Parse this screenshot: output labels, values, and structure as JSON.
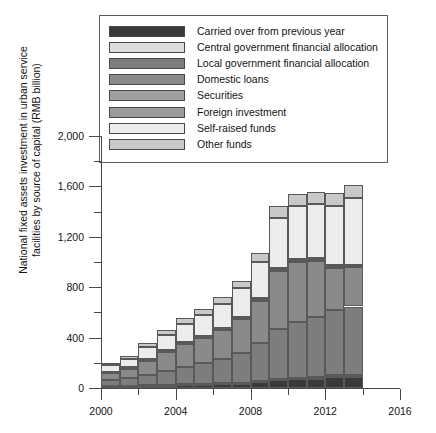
{
  "chart_data": {
    "type": "bar",
    "stacked": true,
    "title": "",
    "xlabel": "",
    "ylabel": "National fixed assets investment in urban service facilities by source of capital (RMB billion)",
    "ylabel_line1": "National fixed assets investment in urban service",
    "ylabel_line2": "facilities by source of capital (RMB billion)",
    "ylim": [
      0,
      2000
    ],
    "ytick_labels": [
      "0",
      "400",
      "800",
      "1,200",
      "1,600",
      "2,000"
    ],
    "ytick_values": [
      0,
      400,
      800,
      1200,
      1600,
      2000
    ],
    "yminor_values": [
      200,
      600,
      1000,
      1400,
      1800
    ],
    "xlim": [
      2000,
      2016
    ],
    "xtick_labels": [
      "2000",
      "2004",
      "2008",
      "2012",
      "2016"
    ],
    "xtick_values": [
      2000,
      2004,
      2008,
      2012,
      2016
    ],
    "xminor_values": [
      2002,
      2006,
      2010,
      2014
    ],
    "grid": false,
    "legend_position": "top",
    "units": "RMB billion",
    "categories": [
      2000,
      2001,
      2002,
      2003,
      2004,
      2005,
      2006,
      2007,
      2008,
      2009,
      2010,
      2011,
      2012,
      2013
    ],
    "series": [
      {
        "name": "Carried over from previous year",
        "color": "#3a3a3a",
        "values": [
          10,
          12,
          15,
          18,
          22,
          26,
          30,
          35,
          45,
          60,
          68,
          75,
          85,
          90
        ]
      },
      {
        "name": "Central government financial allocation",
        "color": "#dcdcdc",
        "values": [
          4,
          4,
          5,
          5,
          6,
          6,
          7,
          8,
          9,
          12,
          14,
          15,
          16,
          17
        ]
      },
      {
        "name": "Local government financial allocation",
        "color": "#7d7d7d",
        "values": [
          48,
          62,
          85,
          110,
          140,
          165,
          195,
          235,
          300,
          400,
          440,
          470,
          520,
          540
        ]
      },
      {
        "name": "Domestic loans",
        "color": "#8a8a8a",
        "values": [
          55,
          75,
          110,
          150,
          180,
          200,
          230,
          270,
          340,
          460,
          480,
          450,
          330,
          310
        ]
      },
      {
        "name": "Securities",
        "color": "#a0a0a0",
        "values": [
          2,
          2,
          3,
          3,
          4,
          4,
          5,
          5,
          6,
          8,
          9,
          10,
          11,
          12
        ]
      },
      {
        "name": "Foreign investment",
        "color": "#9a9a9a",
        "values": [
          8,
          9,
          11,
          12,
          13,
          13,
          12,
          12,
          12,
          13,
          13,
          12,
          12,
          11
        ]
      },
      {
        "name": "Self-raised funds",
        "color": "#ececec",
        "values": [
          52,
          70,
          100,
          125,
          145,
          165,
          190,
          230,
          290,
          400,
          420,
          430,
          470,
          530
        ]
      },
      {
        "name": "Other funds",
        "color": "#c9c9c9",
        "values": [
          16,
          22,
          30,
          38,
          45,
          48,
          52,
          58,
          72,
          88,
          92,
          96,
          100,
          105
        ]
      }
    ],
    "totals": [
      195,
      256,
      359,
      461,
      555,
      627,
      721,
      853,
      1074,
      1441,
      1536,
      1558,
      1544,
      1615
    ]
  },
  "legend": {
    "items": [
      {
        "label": "Carried over from previous year",
        "color": "#3a3a3a"
      },
      {
        "label": "Central government financial allocation",
        "color": "#dcdcdc"
      },
      {
        "label": "Local government financial allocation",
        "color": "#7d7d7d"
      },
      {
        "label": "Domestic loans",
        "color": "#8a8a8a"
      },
      {
        "label": "Securities",
        "color": "#a0a0a0"
      },
      {
        "label": "Foreign investment",
        "color": "#9a9a9a"
      },
      {
        "label": "Self-raised funds",
        "color": "#ececec"
      },
      {
        "label": "Other funds",
        "color": "#c9c9c9"
      }
    ]
  }
}
